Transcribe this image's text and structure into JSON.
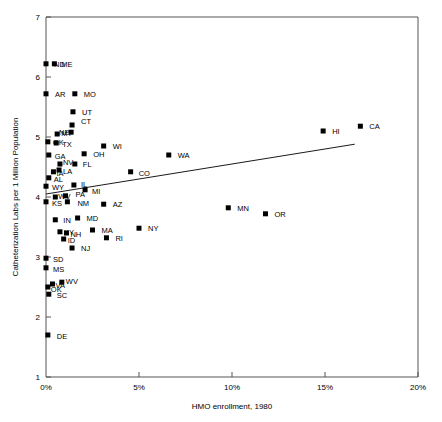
{
  "chart_data": {
    "type": "scatter",
    "title": "",
    "xlabel": "HMO enrollment, 1980",
    "ylabel": "Catheterization Labs per 1 Million Population",
    "xlim": [
      0,
      20
    ],
    "ylim": [
      1,
      7
    ],
    "xtick_labels": [
      "0%",
      "5%",
      "10%",
      "15%",
      "20%"
    ],
    "xtick_values": [
      0,
      5,
      10,
      15,
      20
    ],
    "ytick_labels": [
      "1",
      "2",
      "3",
      "4",
      "5",
      "6",
      "7"
    ],
    "ytick_values": [
      1,
      2,
      3,
      4,
      5,
      6,
      7
    ],
    "grid": false,
    "legend": "none",
    "marker_shape": "square",
    "marker_color": "#000000",
    "fit_line": {
      "present": true,
      "label": "least-squares fit",
      "x_start": 0.0,
      "y_start": 4.05,
      "x_end": 16.6,
      "y_end": 4.88
    },
    "points": [
      {
        "label": "ND",
        "x": 0.0,
        "y": 6.22,
        "label_dx": 8,
        "label_dy": 3
      },
      {
        "label": "ME",
        "x": 0.45,
        "y": 6.22,
        "label_dx": 7,
        "label_dy": 3
      },
      {
        "label": "AR",
        "x": 0.0,
        "y": 5.72,
        "label_dx": 9,
        "label_dy": 3
      },
      {
        "label": "MO",
        "x": 1.55,
        "y": 5.72,
        "label_dx": 9,
        "label_dy": 3
      },
      {
        "label": "UT",
        "x": 1.45,
        "y": 5.42,
        "label_dx": 9,
        "label_dy": 3
      },
      {
        "label": "MT",
        "x": 0.6,
        "y": 5.05,
        "label_dx": 4,
        "label_dy": 2
      },
      {
        "label": "NE",
        "x": 1.35,
        "y": 5.08,
        "label_dx": -12,
        "label_dy": 3
      },
      {
        "label": "CT",
        "x": 1.4,
        "y": 5.2,
        "label_dx": 9,
        "label_dy": -1
      },
      {
        "label": "OK",
        "x": 0.1,
        "y": 4.92,
        "label_dx": 5,
        "label_dy": 3
      },
      {
        "label": "TX",
        "x": 0.55,
        "y": 4.9,
        "label_dx": 6,
        "label_dy": 4
      },
      {
        "label": "WI",
        "x": 3.1,
        "y": 4.85,
        "label_dx": 9,
        "label_dy": 3
      },
      {
        "label": "GA",
        "x": 0.15,
        "y": 4.7,
        "label_dx": 6,
        "label_dy": 4
      },
      {
        "label": "OH",
        "x": 2.05,
        "y": 4.72,
        "label_dx": 9,
        "label_dy": 3
      },
      {
        "label": "WA",
        "x": 6.6,
        "y": 4.7,
        "label_dx": 9,
        "label_dy": 3
      },
      {
        "label": "NV",
        "x": 0.75,
        "y": 4.55,
        "label_dx": 3,
        "label_dy": 1
      },
      {
        "label": "FL",
        "x": 1.55,
        "y": 4.55,
        "label_dx": 8,
        "label_dy": 3
      },
      {
        "label": "HI",
        "x": 14.9,
        "y": 5.1,
        "label_dx": 9,
        "label_dy": 3
      },
      {
        "label": "CA",
        "x": 16.9,
        "y": 5.18,
        "label_dx": 9,
        "label_dy": 3
      },
      {
        "label": "IA",
        "x": 0.4,
        "y": 4.42,
        "label_dx": 3,
        "label_dy": 4
      },
      {
        "label": "LA",
        "x": 0.7,
        "y": 4.45,
        "label_dx": 4,
        "label_dy": 4
      },
      {
        "label": "AL",
        "x": 0.15,
        "y": 4.32,
        "label_dx": 5,
        "label_dy": 4
      },
      {
        "label": "WY",
        "x": 0.0,
        "y": 4.18,
        "label_dx": 6,
        "label_dy": 4
      },
      {
        "label": "IL",
        "x": 1.5,
        "y": 4.2,
        "label_dx": 7,
        "label_dy": 2
      },
      {
        "label": "MI",
        "x": 2.1,
        "y": 4.12,
        "label_dx": 7,
        "label_dy": 4
      },
      {
        "label": "CO",
        "x": 4.55,
        "y": 4.42,
        "label_dx": 8,
        "label_dy": 4
      },
      {
        "label": "WV",
        "x": 0.5,
        "y": 4.0,
        "label_dx": 3,
        "label_dy": 2
      },
      {
        "label": "PA",
        "x": 1.05,
        "y": 4.02,
        "label_dx": 10,
        "label_dy": 1
      },
      {
        "label": "KS",
        "x": 0.0,
        "y": 3.92,
        "label_dx": 6,
        "label_dy": 4
      },
      {
        "label": "NM",
        "x": 1.15,
        "y": 3.92,
        "label_dx": 10,
        "label_dy": 4
      },
      {
        "label": "AZ",
        "x": 3.1,
        "y": 3.88,
        "label_dx": 9,
        "label_dy": 3
      },
      {
        "label": "MN",
        "x": 9.8,
        "y": 3.82,
        "label_dx": 9,
        "label_dy": 3
      },
      {
        "label": "OR",
        "x": 11.8,
        "y": 3.72,
        "label_dx": 9,
        "label_dy": 3
      },
      {
        "label": "IN",
        "x": 0.5,
        "y": 3.62,
        "label_dx": 8,
        "label_dy": 3
      },
      {
        "label": "MD",
        "x": 1.7,
        "y": 3.65,
        "label_dx": 9,
        "label_dy": 3
      },
      {
        "label": "KY",
        "x": 0.75,
        "y": 3.42,
        "label_dx": 4,
        "label_dy": 3
      },
      {
        "label": "NH",
        "x": 1.1,
        "y": 3.4,
        "label_dx": 4,
        "label_dy": 4
      },
      {
        "label": "ID",
        "x": 0.95,
        "y": 3.3,
        "label_dx": 4,
        "label_dy": 4
      },
      {
        "label": "MA",
        "x": 2.5,
        "y": 3.45,
        "label_dx": 9,
        "label_dy": 3
      },
      {
        "label": "RI",
        "x": 3.25,
        "y": 3.32,
        "label_dx": 9,
        "label_dy": 3
      },
      {
        "label": "NY",
        "x": 5.0,
        "y": 3.48,
        "label_dx": 9,
        "label_dy": 3
      },
      {
        "label": "NJ",
        "x": 1.4,
        "y": 3.15,
        "label_dx": 9,
        "label_dy": 3
      },
      {
        "label": "SD",
        "x": 0.0,
        "y": 2.98,
        "label_dx": 7,
        "label_dy": 4
      },
      {
        "label": "MS",
        "x": 0.0,
        "y": 2.82,
        "label_dx": 7,
        "label_dy": 4
      },
      {
        "label": "VA",
        "x": 0.35,
        "y": 2.55,
        "label_dx": 3,
        "label_dy": 4
      },
      {
        "label": "OK2",
        "x": 0.1,
        "y": 2.5,
        "label_dx": 3,
        "label_dy": 5
      },
      {
        "label": "WV2",
        "x": 0.85,
        "y": 2.58,
        "label_dx": 4,
        "label_dy": 2
      },
      {
        "label": "SC",
        "x": 0.15,
        "y": 2.38,
        "label_dx": 8,
        "label_dy": 4
      },
      {
        "label": "DE",
        "x": 0.1,
        "y": 1.7,
        "label_dx": 9,
        "label_dy": 4
      }
    ]
  }
}
